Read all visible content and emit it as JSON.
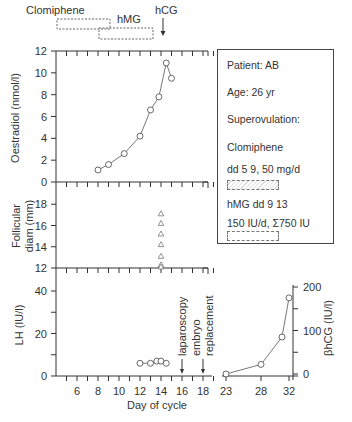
{
  "treatment_bars": {
    "clomiphene_label": "Clomiphene",
    "hmg_label": "hMG",
    "hcg_label": "hCG"
  },
  "legend": {
    "patient": "Patient: AB",
    "age": "Age: 26 yr",
    "superovulation": "Superovulation:",
    "clomiphene": "Clomiphene",
    "clomiphene_dose": "dd  5  9,  50 mg/d",
    "hmg_days": "hMG  dd  9  13",
    "hmg_dose": "150  IU/d, Σ750 IU"
  },
  "events": {
    "laparoscopy": "laparoscopy",
    "embryo": "embryo",
    "replacement": "replacement"
  },
  "chart_data": [
    {
      "type": "line",
      "title": "Oestradiol",
      "ylabel": "Oestradiol (nmol/l)",
      "ylim": [
        0,
        12
      ],
      "yticks": [
        0,
        2,
        4,
        6,
        8,
        10,
        12
      ],
      "x": [
        8,
        9,
        10.5,
        12,
        13,
        13.8,
        14.5,
        15
      ],
      "values": [
        1.1,
        1.6,
        2.6,
        4.2,
        6.6,
        7.8,
        10.9,
        9.5
      ],
      "marker": "open-circle"
    },
    {
      "type": "scatter",
      "title": "Follicular diameter",
      "ylabel": "Follicular diam (mm)",
      "ylim": [
        12,
        20
      ],
      "yticks": [
        12,
        14,
        16,
        18
      ],
      "x": [
        14,
        14,
        14,
        14,
        14,
        14,
        14
      ],
      "values": [
        17.1,
        16.2,
        15.2,
        14.2,
        13.1,
        12.3,
        12.1
      ],
      "marker": "open-triangle"
    },
    {
      "type": "line",
      "title": "LH",
      "ylabel": "LH (IU/l)",
      "xlabel": "Day of cycle",
      "ylim": [
        0,
        45
      ],
      "yticks": [
        0,
        20,
        40
      ],
      "x": [
        12,
        13,
        13.6,
        14,
        14.5
      ],
      "values": [
        6,
        6,
        7,
        7,
        6
      ],
      "xticks": [
        6,
        8,
        10,
        12,
        14,
        16,
        18
      ],
      "marker": "open-circle"
    },
    {
      "type": "line",
      "title": "βhCG",
      "ylabel": "βhCG (IU/l)",
      "ylim": [
        0,
        200
      ],
      "yticks": [
        0,
        100,
        200
      ],
      "x": [
        23,
        28,
        31,
        32
      ],
      "values": [
        0,
        22,
        85,
        175
      ],
      "xticks": [
        23,
        28,
        32
      ],
      "marker": "open-circle"
    }
  ],
  "axis_labels": {
    "oestradiol": "Oestradiol (nmol/l)",
    "follicle_line1": "Follicular",
    "follicle_line2": "diam (mm)",
    "lh": "LH (IU/l)",
    "hcg": "βhCG (IU/l)",
    "xlabel": "Day of cycle"
  }
}
